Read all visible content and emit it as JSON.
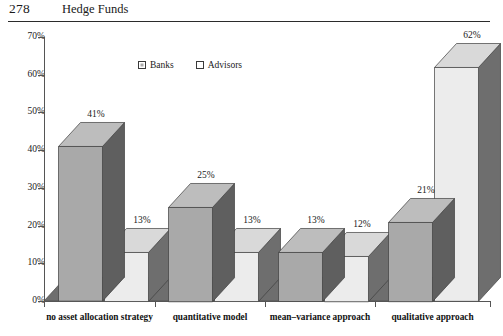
{
  "page": {
    "folio": "278",
    "running_head": "Hedge Funds"
  },
  "chart_data": {
    "type": "bar",
    "title": "",
    "subtitle": "",
    "xlabel": "",
    "ylabel": "",
    "ylim": [
      0,
      70
    ],
    "y_tick_labels": [
      "0%",
      "10%",
      "20%",
      "30%",
      "40%",
      "50%",
      "60%",
      "70%"
    ],
    "y_tick_values": [
      0,
      10,
      20,
      30,
      40,
      50,
      60,
      70
    ],
    "grid": false,
    "legend_position": "top-center",
    "three_d": true,
    "categories": [
      "no asset allocation strategy",
      "quantitative model",
      "mean–variance approach",
      "qualitative approach"
    ],
    "series": [
      {
        "name": "Banks",
        "color": "#a9a9a9",
        "values": [
          41,
          25,
          13,
          21
        ],
        "labels": [
          "41%",
          "25%",
          "13%",
          "21%"
        ]
      },
      {
        "name": "Advisors",
        "color": "#ececec",
        "values": [
          13,
          13,
          12,
          62
        ],
        "labels": [
          "13%",
          "13%",
          "12%",
          "62%"
        ]
      }
    ]
  },
  "legend": {
    "entries": [
      {
        "label": "Banks",
        "swatch": "filled-square-icon"
      },
      {
        "label": "Advisors",
        "swatch": "open-square-icon"
      }
    ]
  }
}
